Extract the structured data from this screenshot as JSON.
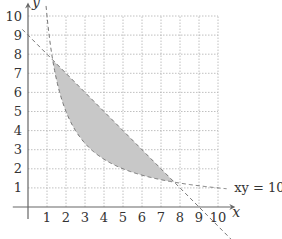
{
  "diagram": {
    "type": "region-plot",
    "axes": {
      "x_label": "x",
      "y_label": "y",
      "x_ticks": [
        "1",
        "2",
        "3",
        "4",
        "5",
        "6",
        "7",
        "8",
        "9",
        "10"
      ],
      "y_ticks": [
        "1",
        "2",
        "3",
        "4",
        "5",
        "6",
        "7",
        "8",
        "9",
        "10"
      ],
      "range": {
        "x": [
          0,
          10
        ],
        "y": [
          0,
          10
        ]
      },
      "grid": "dotted"
    },
    "curves": [
      {
        "name": "hyperbola",
        "equation": "xy = 10",
        "label": "xy = 10",
        "style": "dashed"
      },
      {
        "name": "line",
        "equation": "x + y = 9",
        "label": "x + y = 9",
        "style": "dashed"
      }
    ],
    "shaded_region": {
      "description": "region between line x + y = 9 and hyperbola xy = 10",
      "x_from": 1.298,
      "x_to": 7.702,
      "color": "#c8c8c8"
    },
    "colors": {
      "axis": "#666666",
      "grid": "#b0b0b0",
      "curve": "#777777",
      "fill": "#c8c8c8",
      "text": "#333333"
    }
  }
}
